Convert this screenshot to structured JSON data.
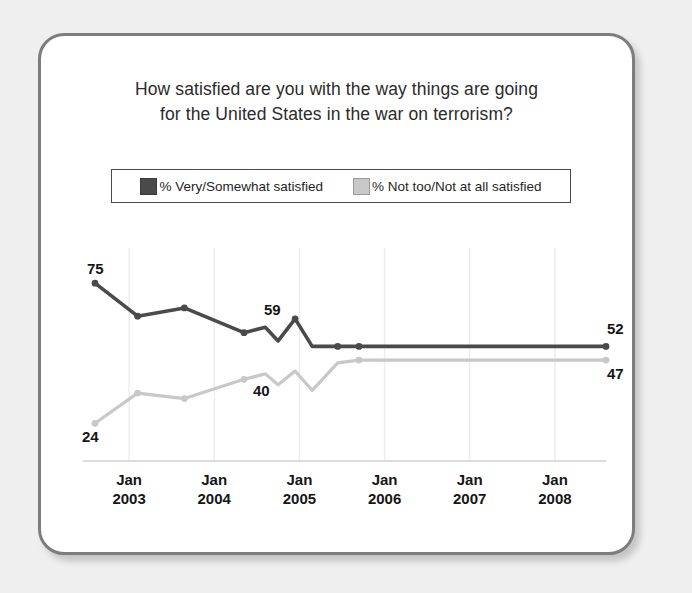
{
  "card": {
    "border_color": "#7d7d7d",
    "background": "#ffffff"
  },
  "title": {
    "line1": "How satisfied are you with the way things are going",
    "line2": "for the United States in the war on terrorism?"
  },
  "legend": {
    "items": [
      {
        "label": "% Very/Somewhat satisfied",
        "color": "#4a4a4a",
        "icon": "legend-swatch-dark"
      },
      {
        "label": "% Not too/Not at all satisfied",
        "color": "#c8c8c8",
        "icon": "legend-swatch-light"
      }
    ]
  },
  "chart_data": {
    "type": "line",
    "title": "How satisfied are you with the way things are going for the United States in the war on terrorism?",
    "xlabel": "",
    "ylabel": "",
    "ylim": [
      15,
      82
    ],
    "grid": true,
    "legend_position": "top",
    "tick_labels": [
      {
        "line1": "Jan",
        "line2": "2003"
      },
      {
        "line1": "Jan",
        "line2": "2004"
      },
      {
        "line1": "Jan",
        "line2": "2005"
      },
      {
        "line1": "Jan",
        "line2": "2006"
      },
      {
        "line1": "Jan",
        "line2": "2007"
      },
      {
        "line1": "Jan",
        "line2": "2008"
      }
    ],
    "x": [
      2002.6,
      2003.1,
      2003.65,
      2004.35,
      2004.6,
      2004.75,
      2004.95,
      2005.15,
      2005.45,
      2005.7,
      2006.0,
      2007.0,
      2008.0,
      2008.6
    ],
    "series": [
      {
        "name": "% Very/Somewhat satisfied",
        "color": "#4a4a4a",
        "values": [
          75,
          63,
          66,
          57,
          59,
          54,
          62,
          52,
          52,
          52,
          52,
          52,
          52,
          52
        ]
      },
      {
        "name": "% Not too/Not at all satisfied",
        "color": "#c8c8c8",
        "values": [
          24,
          35,
          33,
          40,
          42,
          38,
          43,
          36,
          46,
          47,
          47,
          47,
          47,
          47
        ]
      }
    ],
    "annotations": [
      {
        "text": "75",
        "series": "% Very/Somewhat satisfied",
        "value": 75,
        "position": "above-left"
      },
      {
        "text": "59",
        "series": "% Very/Somewhat satisfied",
        "value": 59,
        "position": "above"
      },
      {
        "text": "52",
        "series": "% Very/Somewhat satisfied",
        "value": 52,
        "position": "right-above"
      },
      {
        "text": "24",
        "series": "% Not too/Not at all satisfied",
        "value": 24,
        "position": "below-left"
      },
      {
        "text": "40",
        "series": "% Not too/Not at all satisfied",
        "value": 40,
        "position": "below"
      },
      {
        "text": "47",
        "series": "% Not too/Not at all satisfied",
        "value": 47,
        "position": "right-below"
      }
    ]
  }
}
